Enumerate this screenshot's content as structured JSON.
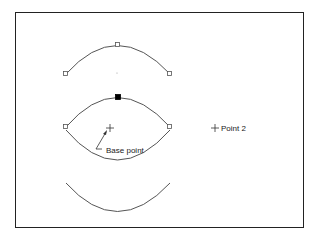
{
  "diagram": {
    "type": "arc-mirror-illustration",
    "labels": {
      "base_point": "Base point",
      "point_2": "Point 2"
    },
    "arcs": [
      {
        "name": "top-arc",
        "grips": [
          "left",
          "top",
          "right"
        ],
        "selected_grip": null
      },
      {
        "name": "middle-arc-pair",
        "grips": [
          "left",
          "top",
          "right"
        ],
        "selected_grip": "top"
      },
      {
        "name": "bottom-arc",
        "grips": []
      }
    ],
    "colors": {
      "line": "#555555",
      "frame": "#222222",
      "grip_hot": "#000000"
    }
  }
}
